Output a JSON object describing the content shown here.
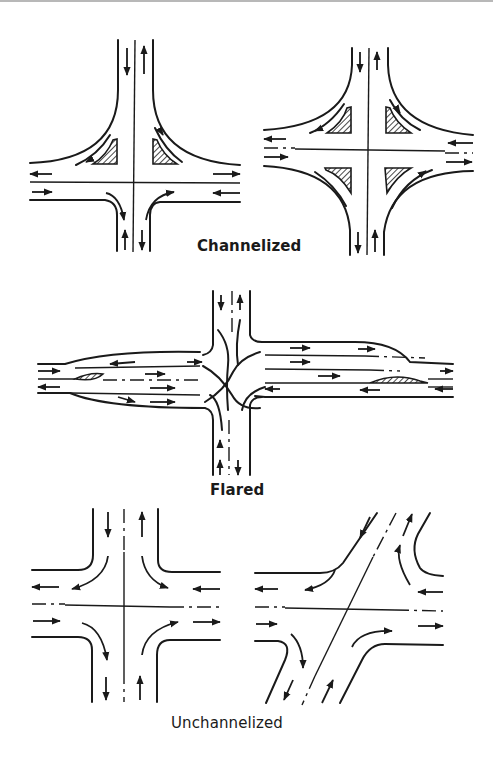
{
  "figure": {
    "panels": [
      {
        "id": "channelized",
        "label": "Channelized",
        "count": 2
      },
      {
        "id": "flared",
        "label": "Flared",
        "count": 1
      },
      {
        "id": "unchannelized",
        "label": "Unchannelized",
        "count": 2
      }
    ]
  },
  "labels": {
    "channelized": "Channelized",
    "flared": "Flared",
    "unchannelized": "Unchannelized"
  },
  "colors": {
    "line": "#1a1a1a",
    "background": "#ffffff"
  }
}
